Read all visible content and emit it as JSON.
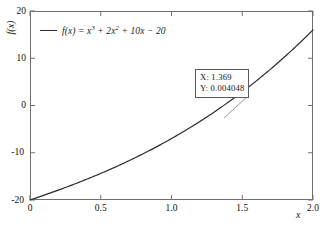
{
  "chart_data": {
    "type": "line",
    "title": "",
    "xlabel": "x",
    "ylabel": "f(x)",
    "xlim": [
      0,
      2
    ],
    "ylim": [
      -20,
      20
    ],
    "grid": false,
    "legend_position": "top-left",
    "xticks": [
      "0",
      "0.5",
      "1.0",
      "1.5",
      "2.0"
    ],
    "xtick_values": [
      0,
      0.5,
      1.0,
      1.5,
      2.0
    ],
    "yticks": [
      "20",
      "10",
      "0",
      "-10",
      "-20"
    ],
    "ytick_values": [
      20,
      10,
      0,
      -10,
      -20
    ],
    "series": [
      {
        "name": "f(x) = x^3 + 2x^2 + 10x - 20",
        "color": "#2b2b2b",
        "x": [
          0,
          0.1,
          0.2,
          0.3,
          0.4,
          0.5,
          0.6,
          0.7,
          0.8,
          0.9,
          1.0,
          1.1,
          1.2,
          1.3,
          1.369,
          1.4,
          1.5,
          1.6,
          1.7,
          1.8,
          1.9,
          2.0
        ],
        "values": [
          -20,
          -18.979,
          -17.912,
          -16.793,
          -15.616,
          -14.375,
          -13.064,
          -11.677,
          -10.208,
          -8.651,
          -7.0,
          -5.249,
          -3.392,
          -1.423,
          0.004048,
          0.664,
          2.875,
          5.216,
          7.693,
          10.312,
          13.079,
          16.0
        ]
      }
    ],
    "legend": [
      {
        "prefix": "f(x) = x",
        "exp1": "3",
        "mid1": " + 2x",
        "exp2": "2",
        "mid2": " + 10x ",
        "minus": "−",
        "tail": " 20",
        "full_text": "f(x) = x³ + 2x² + 10x − 20"
      }
    ],
    "annotations": [
      {
        "name": "data-cursor",
        "x_label": "X: 1.369",
        "y_label": "Y: 0.004048",
        "x_value": 1.369,
        "y_value": 0.004048,
        "marker_x": 1.369,
        "marker_y": 0.004048
      }
    ]
  },
  "axes": {
    "x_title": "x",
    "y_title": "f(x)"
  }
}
